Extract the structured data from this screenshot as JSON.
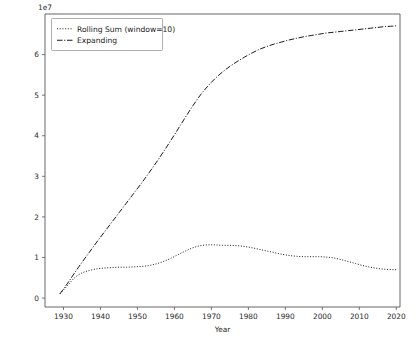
{
  "chart_data": {
    "type": "line",
    "title": "",
    "xlabel": "Year",
    "ylabel": "",
    "y_offset_text": "1e7",
    "y_offset_multiplier": 10000000,
    "xlim": [
      1925,
      2021
    ],
    "ylim": [
      -0.22,
      7.0
    ],
    "xticks": [
      1930,
      1940,
      1950,
      1960,
      1970,
      1980,
      1990,
      2000,
      2010,
      2020
    ],
    "xticklabels": [
      "1930",
      "1940",
      "1950",
      "1960",
      "1970",
      "1980",
      "1990",
      "2000",
      "2010",
      "2020"
    ],
    "yticks": [
      0,
      1,
      2,
      3,
      4,
      5,
      6
    ],
    "yticklabels": [
      "0",
      "1",
      "2",
      "3",
      "4",
      "5",
      "6"
    ],
    "grid": false,
    "legend_position": "upper left",
    "x": [
      1929,
      1931,
      1933,
      1935,
      1937,
      1939,
      1941,
      1943,
      1945,
      1947,
      1949,
      1951,
      1953,
      1955,
      1957,
      1959,
      1961,
      1963,
      1965,
      1967,
      1969,
      1971,
      1973,
      1975,
      1977,
      1979,
      1981,
      1983,
      1985,
      1987,
      1989,
      1991,
      1993,
      1995,
      1997,
      1999,
      2001,
      2003,
      2005,
      2007,
      2009,
      2011,
      2013,
      2015,
      2017,
      2019,
      2020
    ],
    "series": [
      {
        "name": "Rolling Sum (window=10)",
        "linestyle": "dotted",
        "color": "#1a1a1a",
        "values": [
          0.1,
          0.3,
          0.5,
          0.62,
          0.68,
          0.72,
          0.74,
          0.75,
          0.76,
          0.76,
          0.77,
          0.78,
          0.8,
          0.84,
          0.9,
          0.98,
          1.07,
          1.16,
          1.24,
          1.29,
          1.31,
          1.31,
          1.3,
          1.3,
          1.29,
          1.27,
          1.24,
          1.2,
          1.16,
          1.12,
          1.08,
          1.05,
          1.03,
          1.02,
          1.02,
          1.02,
          1.01,
          0.99,
          0.95,
          0.9,
          0.85,
          0.8,
          0.76,
          0.73,
          0.71,
          0.7,
          0.7
        ]
      },
      {
        "name": "Expanding",
        "linestyle": "dashdot",
        "color": "#1a1a1a",
        "values": [
          0.1,
          0.35,
          0.62,
          0.88,
          1.13,
          1.38,
          1.62,
          1.86,
          2.1,
          2.34,
          2.58,
          2.82,
          3.07,
          3.33,
          3.6,
          3.88,
          4.17,
          4.46,
          4.74,
          5.0,
          5.22,
          5.41,
          5.57,
          5.71,
          5.83,
          5.94,
          6.04,
          6.13,
          6.2,
          6.26,
          6.31,
          6.36,
          6.4,
          6.44,
          6.47,
          6.5,
          6.53,
          6.55,
          6.57,
          6.59,
          6.61,
          6.63,
          6.65,
          6.67,
          6.69,
          6.7,
          6.71
        ]
      }
    ]
  },
  "legend": {
    "entries": [
      {
        "label": "Rolling Sum (window=10)",
        "dash": "dotted"
      },
      {
        "label": "Expanding",
        "dash": "dashdot"
      }
    ]
  }
}
